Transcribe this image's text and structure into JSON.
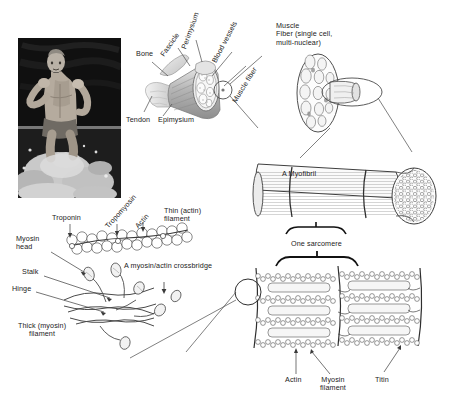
{
  "figure": {
    "background_color": "#ffffff",
    "ink_color": "#222222",
    "width": 460,
    "height": 403
  },
  "photo": {
    "name": "runner-photograph",
    "description": "Black and white photograph of a shirtless male runner splashing through shallow water",
    "tone_dark": "#141414",
    "tone_mid": "#7d7d7d",
    "tone_light": "#e8e8e8"
  },
  "whole_muscle": {
    "labels": {
      "bone": "Bone",
      "tendon": "Tendon",
      "fascicle": "Fascicle",
      "perimysium": "Perimysium",
      "epimysium": "Epimysium",
      "blood_vessels": "Blood vessels",
      "muscle_fiber": "Muscle fiber"
    }
  },
  "muscle_fiber": {
    "label": "Muscle\nFiber (single cell,\nmulti-nuclear)"
  },
  "myofibril": {
    "label": "A Myofibril",
    "sarcomere_label": "One sarcomere"
  },
  "sarcomere_detail": {
    "labels": {
      "actin": "Actin",
      "myosin_filament": "Myosin\nfilament",
      "titin": "Titin"
    }
  },
  "molecular": {
    "labels": {
      "troponin": "Troponin",
      "tropomyosin": "Tropomyosin",
      "actin": "Actin",
      "thin_filament": "Thin (actin)\nfilament",
      "myosin_head": "Myosin\nhead",
      "stalk": "Stalk",
      "hinge": "Hinge",
      "crossbridge": "A myosin/actin crossbridge",
      "thick_filament": "Thick (myosin)\nfilament"
    }
  }
}
